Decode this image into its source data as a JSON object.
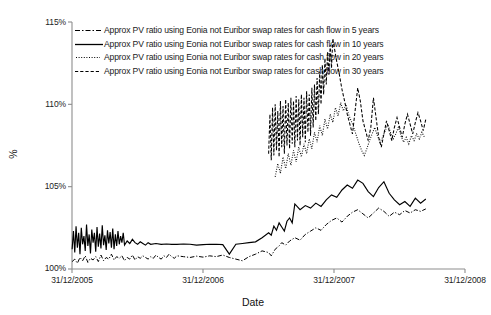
{
  "chart_data": {
    "type": "line",
    "title": "",
    "xlabel": "Date",
    "ylabel": "%",
    "grid": false,
    "legend_position": "top-left",
    "x_ticks": [
      "31/12/2005",
      "31/12/2006",
      "31/12/2007",
      "31/12/2008"
    ],
    "y_ticks": [
      "100%",
      "105%",
      "110%",
      "115%"
    ],
    "xlim": [
      "31/12/2005",
      "31/12/2008"
    ],
    "ylim": [
      100,
      115
    ],
    "y_tick_values": [
      100,
      105,
      110,
      115
    ],
    "x_tick_values": [
      2005.999,
      2006.999,
      2007.999,
      2008.999
    ],
    "series": [
      {
        "name": "Approx PV ratio using Eonia not Euribor swap rates for cash flow in 5 years",
        "maturity_years": 5,
        "style": "dash-dot",
        "color": "#000000",
        "x": [
          2006.0,
          2006.02,
          2006.04,
          2006.06,
          2006.08,
          2006.1,
          2006.12,
          2006.14,
          2006.16,
          2006.18,
          2006.2,
          2006.22,
          2006.24,
          2006.26,
          2006.28,
          2006.3,
          2006.32,
          2006.34,
          2006.36,
          2006.38,
          2006.4,
          2006.42,
          2006.44,
          2006.46,
          2006.48,
          2006.5,
          2006.52,
          2006.54,
          2006.56,
          2006.58,
          2006.6,
          2006.62,
          2006.64,
          2006.66,
          2006.68,
          2006.7,
          2006.72,
          2006.74,
          2006.76,
          2006.78,
          2006.8,
          2006.85,
          2006.9,
          2006.95,
          2007.0,
          2007.05,
          2007.1,
          2007.15,
          2007.2,
          2007.25,
          2007.3,
          2007.35,
          2007.4,
          2007.45,
          2007.5,
          2007.52,
          2007.55,
          2007.58,
          2007.6,
          2007.63,
          2007.66,
          2007.7,
          2007.74,
          2007.78,
          2007.82,
          2007.86,
          2007.9,
          2007.94,
          2007.98,
          2008.02,
          2008.06,
          2008.1,
          2008.14,
          2008.18,
          2008.22,
          2008.26,
          2008.3,
          2008.34,
          2008.38,
          2008.42,
          2008.46,
          2008.5,
          2008.54,
          2008.58,
          2008.62,
          2008.66,
          2008.7
        ],
        "y": [
          100.45,
          100.6,
          100.35,
          100.7,
          100.5,
          100.8,
          100.4,
          100.65,
          100.55,
          100.75,
          100.45,
          100.85,
          100.5,
          100.7,
          100.6,
          100.9,
          100.55,
          100.75,
          100.65,
          100.8,
          100.5,
          100.7,
          100.6,
          100.85,
          100.55,
          100.75,
          100.65,
          100.8,
          100.7,
          100.6,
          100.75,
          100.65,
          100.85,
          100.7,
          100.6,
          100.8,
          100.7,
          100.9,
          100.75,
          100.65,
          100.8,
          100.75,
          100.7,
          100.78,
          100.72,
          100.8,
          100.75,
          100.85,
          100.7,
          100.6,
          100.5,
          100.75,
          100.9,
          101.1,
          101.0,
          100.8,
          101.2,
          101.4,
          101.6,
          101.45,
          101.7,
          101.9,
          101.75,
          102.1,
          102.3,
          102.5,
          102.35,
          102.7,
          102.95,
          103.1,
          102.85,
          103.2,
          103.45,
          103.6,
          103.35,
          103.1,
          103.4,
          103.7,
          103.5,
          103.2,
          103.45,
          103.3,
          103.55,
          103.4,
          103.6,
          103.5,
          103.65
        ]
      },
      {
        "name": "Approx PV ratio using Eonia not Euribor swap rates for cash flow in 10 years",
        "maturity_years": 10,
        "style": "solid",
        "color": "#000000",
        "x": [
          2006.0,
          2006.01,
          2006.02,
          2006.03,
          2006.04,
          2006.05,
          2006.06,
          2006.07,
          2006.08,
          2006.09,
          2006.1,
          2006.11,
          2006.12,
          2006.13,
          2006.14,
          2006.15,
          2006.16,
          2006.17,
          2006.18,
          2006.19,
          2006.2,
          2006.21,
          2006.22,
          2006.23,
          2006.24,
          2006.25,
          2006.26,
          2006.27,
          2006.28,
          2006.29,
          2006.3,
          2006.31,
          2006.32,
          2006.33,
          2006.34,
          2006.35,
          2006.36,
          2006.37,
          2006.38,
          2006.39,
          2006.4,
          2006.42,
          2006.44,
          2006.46,
          2006.48,
          2006.5,
          2006.52,
          2006.54,
          2006.56,
          2006.58,
          2006.6,
          2006.64,
          2006.68,
          2006.72,
          2006.76,
          2006.8,
          2006.85,
          2006.9,
          2006.95,
          2007.0,
          2007.05,
          2007.1,
          2007.15,
          2007.2,
          2007.25,
          2007.3,
          2007.35,
          2007.4,
          2007.45,
          2007.5,
          2007.52,
          2007.54,
          2007.56,
          2007.58,
          2007.6,
          2007.62,
          2007.64,
          2007.66,
          2007.68,
          2007.7,
          2007.74,
          2007.78,
          2007.82,
          2007.86,
          2007.9,
          2007.94,
          2007.98,
          2008.02,
          2008.06,
          2008.1,
          2008.14,
          2008.18,
          2008.22,
          2008.26,
          2008.3,
          2008.34,
          2008.38,
          2008.42,
          2008.46,
          2008.5,
          2008.54,
          2008.58,
          2008.62,
          2008.66,
          2008.7
        ],
        "y": [
          101.2,
          102.3,
          101.0,
          102.6,
          101.3,
          102.2,
          100.9,
          102.5,
          101.5,
          102.0,
          101.1,
          102.7,
          101.4,
          102.1,
          100.95,
          102.4,
          101.6,
          102.2,
          101.05,
          102.55,
          101.35,
          102.15,
          101.25,
          102.65,
          101.45,
          102.05,
          101.15,
          102.35,
          101.55,
          102.25,
          101.3,
          102.45,
          101.2,
          102.1,
          101.4,
          102.3,
          101.5,
          102.0,
          101.6,
          102.2,
          101.45,
          101.7,
          101.55,
          101.8,
          101.6,
          101.5,
          101.65,
          101.55,
          101.45,
          101.6,
          101.5,
          101.55,
          101.5,
          101.52,
          101.5,
          101.5,
          101.52,
          101.5,
          101.45,
          101.48,
          101.5,
          101.5,
          101.48,
          100.9,
          101.5,
          101.55,
          101.6,
          101.65,
          101.9,
          102.2,
          102.05,
          102.6,
          102.35,
          102.8,
          102.55,
          102.3,
          102.9,
          103.1,
          102.8,
          103.95,
          103.6,
          103.85,
          103.7,
          104.0,
          103.8,
          104.2,
          104.5,
          104.35,
          104.8,
          105.1,
          104.9,
          105.4,
          105.2,
          104.7,
          104.4,
          104.95,
          105.3,
          104.6,
          104.2,
          103.9,
          104.1,
          103.8,
          104.3,
          104.0,
          104.25
        ]
      },
      {
        "name": "Approx PV ratio using Eonia not Euribor swap rates for cash flow in 20 years",
        "maturity_years": 20,
        "style": "dotted",
        "color": "#000000",
        "x": [
          2007.55,
          2007.57,
          2007.59,
          2007.61,
          2007.63,
          2007.65,
          2007.67,
          2007.69,
          2007.71,
          2007.73,
          2007.75,
          2007.77,
          2007.79,
          2007.81,
          2007.83,
          2007.85,
          2007.87,
          2007.89,
          2007.91,
          2007.93,
          2007.95,
          2007.97,
          2007.99,
          2008.01,
          2008.03,
          2008.05,
          2008.07,
          2008.09,
          2008.11,
          2008.13,
          2008.15,
          2008.17,
          2008.19,
          2008.21,
          2008.23,
          2008.25,
          2008.27,
          2008.29,
          2008.31,
          2008.33,
          2008.35,
          2008.37,
          2008.39,
          2008.41,
          2008.43,
          2008.45,
          2008.47,
          2008.49,
          2008.51,
          2008.53,
          2008.55,
          2008.57,
          2008.59,
          2008.61,
          2008.63,
          2008.65,
          2008.67,
          2008.69
        ],
        "y": [
          105.6,
          106.4,
          105.8,
          106.8,
          106.1,
          107.0,
          106.3,
          107.2,
          106.5,
          107.4,
          106.8,
          107.6,
          107.0,
          107.9,
          107.3,
          108.3,
          107.7,
          108.7,
          108.1,
          109.1,
          108.5,
          109.4,
          108.9,
          109.8,
          109.3,
          110.1,
          109.6,
          110.0,
          109.4,
          109.0,
          108.6,
          108.1,
          107.6,
          107.2,
          106.9,
          107.3,
          107.8,
          108.2,
          108.6,
          108.1,
          107.7,
          108.0,
          108.4,
          108.8,
          108.3,
          107.9,
          108.2,
          108.6,
          108.1,
          107.7,
          108.0,
          107.6,
          108.1,
          107.8,
          108.2,
          107.9,
          108.3,
          108.0
        ]
      },
      {
        "name": "Approx PV ratio using Eonia not Euribor swap rates for cash flow in 30 years",
        "maturity_years": 30,
        "style": "dashed",
        "color": "#000000",
        "x": [
          2007.5,
          2007.51,
          2007.52,
          2007.53,
          2007.54,
          2007.55,
          2007.56,
          2007.57,
          2007.58,
          2007.59,
          2007.6,
          2007.61,
          2007.62,
          2007.63,
          2007.64,
          2007.65,
          2007.66,
          2007.67,
          2007.68,
          2007.69,
          2007.7,
          2007.71,
          2007.72,
          2007.73,
          2007.74,
          2007.75,
          2007.76,
          2007.77,
          2007.78,
          2007.79,
          2007.8,
          2007.81,
          2007.82,
          2007.83,
          2007.84,
          2007.85,
          2007.86,
          2007.87,
          2007.88,
          2007.89,
          2007.9,
          2007.91,
          2007.92,
          2007.93,
          2007.94,
          2007.95,
          2007.96,
          2007.97,
          2007.98,
          2007.99,
          2008.0,
          2008.02,
          2008.04,
          2008.06,
          2008.08,
          2008.1,
          2008.12,
          2008.14,
          2008.16,
          2008.18,
          2008.2,
          2008.22,
          2008.24,
          2008.26,
          2008.28,
          2008.3,
          2008.32,
          2008.34,
          2008.36,
          2008.38,
          2008.4,
          2008.42,
          2008.44,
          2008.46,
          2008.48,
          2008.5,
          2008.52,
          2008.54,
          2008.56,
          2008.58,
          2008.6,
          2008.62,
          2008.64,
          2008.66,
          2008.68,
          2008.7
        ],
        "y": [
          107.0,
          109.4,
          106.6,
          109.8,
          106.9,
          110.0,
          107.2,
          109.6,
          106.8,
          110.2,
          107.4,
          109.9,
          107.0,
          110.3,
          107.5,
          110.1,
          107.3,
          110.4,
          107.6,
          110.2,
          107.4,
          110.5,
          107.8,
          110.3,
          107.5,
          110.6,
          108.0,
          110.4,
          107.7,
          110.8,
          108.3,
          110.6,
          108.1,
          111.0,
          108.6,
          111.2,
          109.0,
          111.6,
          109.4,
          112.0,
          110.0,
          112.4,
          110.6,
          112.8,
          111.2,
          113.2,
          111.8,
          113.6,
          112.2,
          114.0,
          113.5,
          112.6,
          111.8,
          110.9,
          110.2,
          109.4,
          108.8,
          108.2,
          109.6,
          111.0,
          110.2,
          109.0,
          108.4,
          107.8,
          108.6,
          110.4,
          109.2,
          108.0,
          107.4,
          108.2,
          109.0,
          108.4,
          107.8,
          108.6,
          109.2,
          108.6,
          108.0,
          108.8,
          109.4,
          108.8,
          108.2,
          108.9,
          109.5,
          109.0,
          108.4,
          109.1
        ]
      }
    ]
  }
}
